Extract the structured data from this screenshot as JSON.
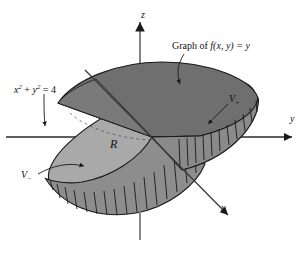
{
  "figure": {
    "background_color": "#ffffff",
    "line_color": "#1a1a1a"
  },
  "axes": {
    "z_label": "z",
    "y_label": "y",
    "x_label": "x"
  },
  "labels": {
    "graph_of": {
      "prefix": "Graph of ",
      "expression": "f(x, y) = y",
      "full": "Graph of f(x, y) = y"
    },
    "circle": {
      "x_term": "x",
      "x_exp": "2",
      "plus": " + ",
      "y_term": "y",
      "y_exp": "2",
      "equals": " = 4",
      "full": "x2 + y2 = 4"
    },
    "region": "R",
    "volume_positive": "V",
    "volume_positive_sub": "+",
    "volume_negative": "V",
    "volume_negative_sub": "−"
  },
  "colors": {
    "surface_dark": "#6f6f6f",
    "surface_mid": "#8a8a8a",
    "disk_light": "#a9a9a9",
    "disk_shadow": "#9a9a9a",
    "rib_fill": "#808080",
    "outline": "#1a1a1a",
    "axis": "#555555"
  },
  "geometry": {
    "disk_center_x": 152,
    "disk_center_y": 137,
    "disk_radius_x": 112,
    "disk_radius_y": 40,
    "tilt_degrees": -24,
    "rib_count_positive": 9,
    "rib_count_negative": 13
  }
}
